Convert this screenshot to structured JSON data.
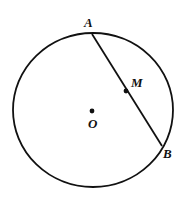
{
  "diagram": {
    "colors": {
      "stroke": "#111111",
      "background": "#ffffff"
    },
    "circle": {
      "cx": 93,
      "cy": 110,
      "rx": 80,
      "ry": 77,
      "stroke_width": 1.8
    },
    "chord": {
      "x1": 92,
      "y1": 34,
      "x2": 162,
      "y2": 146,
      "stroke_width": 1.8
    },
    "points": {
      "A": {
        "label": "A",
        "label_x": 84,
        "label_y": 27
      },
      "B": {
        "label": "B",
        "label_x": 163,
        "label_y": 158
      },
      "M": {
        "label": "M",
        "x": 126,
        "y": 91,
        "label_x": 131,
        "label_y": 87
      },
      "O": {
        "label": "O",
        "x": 92,
        "y": 111,
        "label_x": 88,
        "label_y": 128
      }
    }
  }
}
